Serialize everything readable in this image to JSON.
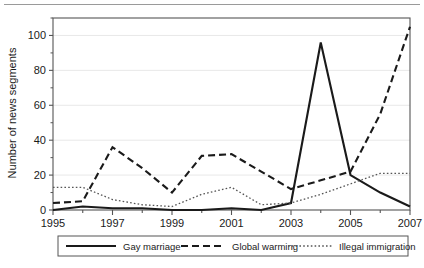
{
  "figure": {
    "background": "#ffffff",
    "frame_color": "#555555",
    "grid_color": "#e8e8e8",
    "top_rule_color": "#9a9a9a"
  },
  "chart_data": {
    "type": "line",
    "title": "",
    "subtitle": "",
    "xlabel": "",
    "ylabel": "Number of news segments",
    "xlim": [
      1995,
      2007
    ],
    "ylim": [
      0,
      110
    ],
    "yticks": [
      0,
      20,
      40,
      60,
      80,
      100
    ],
    "ytick_labels": [
      "0",
      "20",
      "40",
      "60",
      "80",
      "100"
    ],
    "xticks": [
      1995,
      1996,
      1997,
      1998,
      1999,
      2000,
      2001,
      2002,
      2003,
      2004,
      2005,
      2006,
      2007
    ],
    "xtick_labels_shown": [
      "1995",
      "1997",
      "1999",
      "2001",
      "2003",
      "2005",
      "2007"
    ],
    "x": [
      1995,
      1996,
      1997,
      1998,
      1999,
      2000,
      2001,
      2002,
      2003,
      2004,
      2005,
      2006,
      2007
    ],
    "grid": true,
    "grid_axis": "y",
    "legend_position": "below",
    "series": [
      {
        "name": "Gay marriage",
        "style": "solid",
        "color": "#1a1a1a",
        "width": 2.1,
        "values": [
          0,
          2,
          1,
          1,
          0,
          0,
          1,
          0,
          4,
          96,
          20,
          10,
          2
        ]
      },
      {
        "name": "Global warming",
        "style": "dashed",
        "color": "#1a1a1a",
        "width": 2.1,
        "values": [
          4,
          5,
          36,
          24,
          10,
          31,
          32,
          22,
          12,
          17,
          22,
          55,
          105
        ]
      },
      {
        "name": "Illegal immigration",
        "style": "dotted",
        "color": "#555555",
        "width": 1.3,
        "values": [
          13,
          13,
          6,
          3,
          2,
          9,
          13,
          3,
          4,
          9,
          15,
          21,
          21
        ]
      }
    ]
  },
  "legend": {
    "entries": [
      {
        "label": "Gay marriage",
        "style": "solid"
      },
      {
        "label": "Global warming",
        "style": "dashed"
      },
      {
        "label": "Illegal immigration",
        "style": "dotted"
      }
    ]
  }
}
